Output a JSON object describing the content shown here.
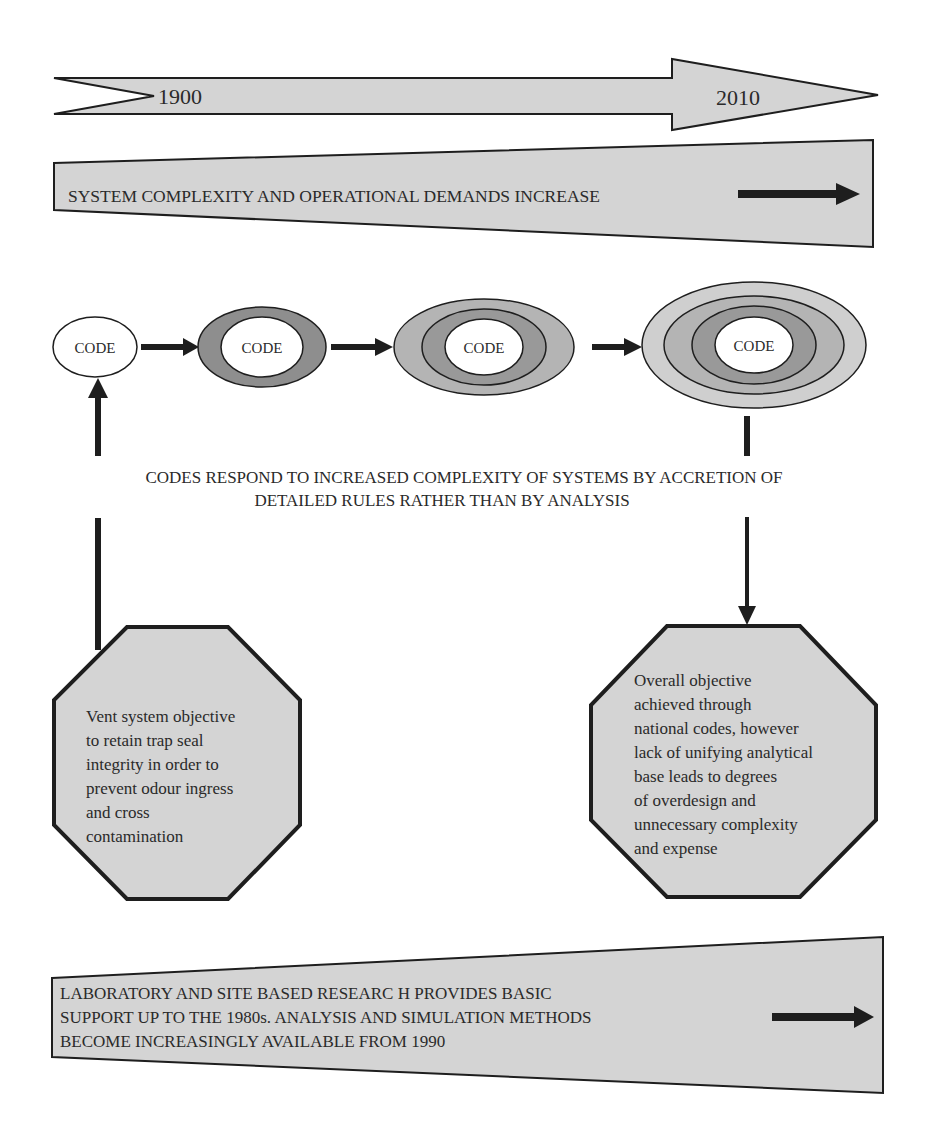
{
  "timeline": {
    "start_label": "1900",
    "end_label": "2010"
  },
  "top_band": {
    "text": "SYSTEM COMPLEXITY AND OPERATIONAL DEMANDS INCREASE"
  },
  "code_stages": [
    {
      "label": "CODE",
      "rings": 0
    },
    {
      "label": "CODE",
      "rings": 1
    },
    {
      "label": "CODE",
      "rings": 2
    },
    {
      "label": "CODE",
      "rings": 3
    }
  ],
  "middle_caption": {
    "line1": "CODES RESPOND TO INCREASED COMPLEXITY OF SYSTEMS  BY ACCRETION OF",
    "line2": "DETAILED RULES  RATHER THAN BY ANALYSIS"
  },
  "left_octagon": {
    "text": "Vent system objective\nto retain trap seal\nintegrity in order to\nprevent odour  ingress\nand cross\ncontamination"
  },
  "right_octagon": {
    "text": "Overall objective\nachieved through\nnational codes, however\nlack of unifying analytical\nbase leads to degrees\nof overdesign and\nunnecessary complexity\nand expense"
  },
  "bottom_band": {
    "line1": "LABORATORY AND SITE BASED   RESEARC H PROVIDES BASIC",
    "line2": "SUPPORT UP TO THE 1980s.    ANALYSIS AND SIMULATION METHODS",
    "line3": "BECOME INCREASINGLY AVAILABLE FROM  1990"
  },
  "colors": {
    "band_fill": "#d4d4d4",
    "ring_outer": "#cfcfcf",
    "ring_mid": "#b4b4b4",
    "ring_dark": "#999999",
    "ring_single": "#8e8e8e",
    "stroke": "#1e1e1e",
    "background": "#ffffff"
  }
}
